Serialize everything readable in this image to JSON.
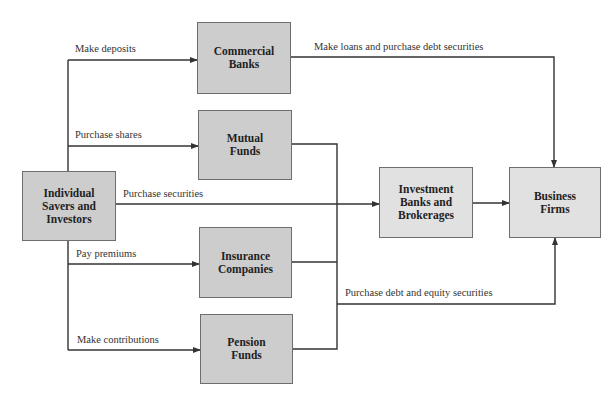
{
  "nodes": {
    "individual": {
      "label": "Individual\nSavers and\nInvestors"
    },
    "commercial_banks": {
      "label": "Commercial\nBanks"
    },
    "mutual_funds": {
      "label": "Mutual\nFunds"
    },
    "insurance_companies": {
      "label": "Insurance\nCompanies"
    },
    "pension_funds": {
      "label": "Pension\nFunds"
    },
    "investment_banks": {
      "label": "Investment\nBanks and\nBrokerages"
    },
    "business_firms": {
      "label": "Business\nFirms"
    }
  },
  "edges": {
    "make_deposits": "Make deposits",
    "purchase_shares": "Purchase shares",
    "purchase_securities": "Purchase securities",
    "pay_premiums": "Pay premiums",
    "make_contributions": "Make contributions",
    "make_loans": "Make loans and purchase debt securities",
    "purchase_debt_equity": "Purchase debt and equity securities"
  },
  "colors": {
    "box_dark": "#cdcdcd",
    "box_light": "#e1e1e1",
    "line": "#333333"
  }
}
